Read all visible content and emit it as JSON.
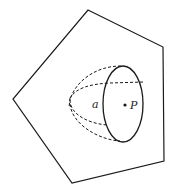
{
  "diagram": {
    "labels": {
      "a": "a",
      "P": "P"
    },
    "colors": {
      "stroke": "#1a1a1a",
      "background": "#ffffff"
    },
    "shapes": {
      "pentagon": "88,10 163,47 164,161 72,183 13,99",
      "ellipse": {
        "cx": 123,
        "cy": 104,
        "rx": 20,
        "ry": 38
      },
      "point_P": {
        "x": 125,
        "y": 105
      }
    }
  }
}
